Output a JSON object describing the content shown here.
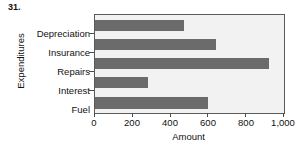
{
  "problem": {
    "number": "31."
  },
  "chart_data": {
    "type": "bar",
    "orientation": "horizontal",
    "title": "",
    "xlabel": "Amount",
    "ylabel": "Expenditures",
    "categories": [
      "Depreciation",
      "Insurance",
      "Repairs",
      "Interest",
      "Fuel"
    ],
    "values": [
      470,
      640,
      920,
      280,
      600
    ],
    "xlim": [
      0,
      1000
    ],
    "xticks": [
      0,
      200,
      400,
      600,
      800,
      1000
    ],
    "xtick_labels": [
      "0",
      "200",
      "400",
      "600",
      "800",
      "1,000"
    ],
    "grid": false,
    "legend": false,
    "bar_color": "#6b6b6b",
    "plot_background": "#f2f2f2",
    "frame_color": "#5a5a5a"
  }
}
